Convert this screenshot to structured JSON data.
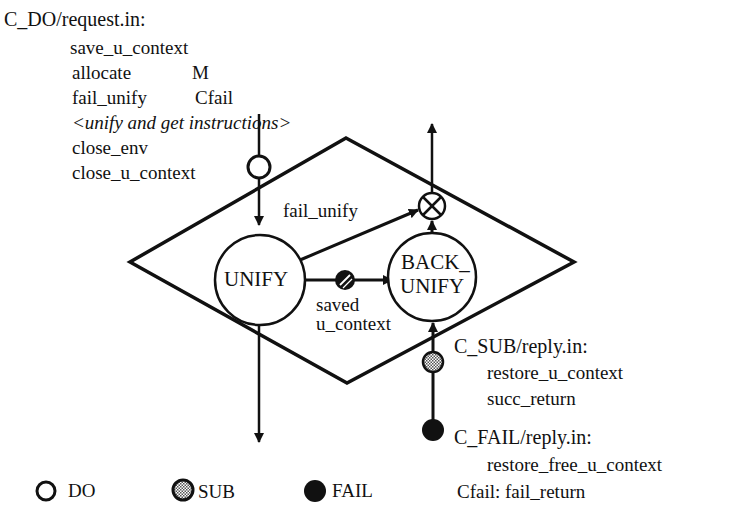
{
  "request_block": {
    "title": "C_DO/request.in:",
    "lines": [
      {
        "op": "save_u_context",
        "arg": ""
      },
      {
        "op": "allocate",
        "arg": "M"
      },
      {
        "op": "fail_unify",
        "arg": "Cfail"
      },
      {
        "op": "<unify and get instructions>",
        "arg": ""
      },
      {
        "op": "close_env",
        "arg": ""
      },
      {
        "op": "close_u_context",
        "arg": ""
      }
    ]
  },
  "nodes": {
    "unify": "UNIFY",
    "back_unify_line1": "BACK_",
    "back_unify_line2": "UNIFY"
  },
  "edges": {
    "fail_unify": "fail_unify",
    "saved_line1": "saved",
    "saved_line2": "u_context"
  },
  "sub_block": {
    "title": "C_SUB/reply.in:",
    "lines": [
      "restore_u_context",
      "succ_return"
    ]
  },
  "fail_block": {
    "title": "C_FAIL/reply.in:",
    "lines": [
      "restore_free_u_context"
    ],
    "footer": "Cfail: fail_return"
  },
  "legend": [
    {
      "symbol": "open-circle",
      "label": "DO"
    },
    {
      "symbol": "hatched-circle",
      "label": "SUB"
    },
    {
      "symbol": "filled-circle",
      "label": "FAIL"
    }
  ]
}
